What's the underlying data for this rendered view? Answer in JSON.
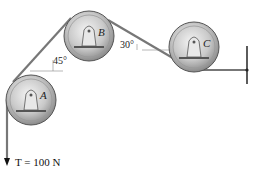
{
  "diagram": {
    "type": "pulley-system",
    "pulleys": [
      {
        "label": "A",
        "cx": 31,
        "cy": 100,
        "r": 25
      },
      {
        "label": "B",
        "cx": 89,
        "cy": 36,
        "r": 25
      },
      {
        "label": "C",
        "cx": 194,
        "cy": 47,
        "r": 25
      }
    ],
    "angles": [
      {
        "text": "45°",
        "between": "A-B rope and horizontal"
      },
      {
        "text": "30°",
        "between": "B-C rope and horizontal"
      }
    ],
    "tension": {
      "symbol": "T",
      "equals": "= 100 N",
      "full": "T = 100 N"
    },
    "support": "wall"
  }
}
